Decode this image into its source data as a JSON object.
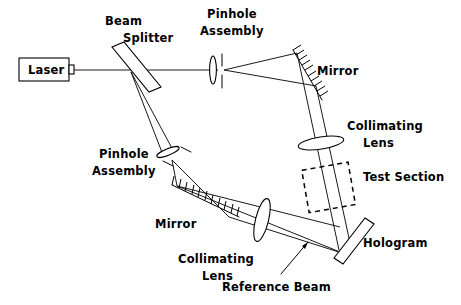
{
  "figure": {
    "background_color": "#ffffff",
    "line_color": "#000000"
  },
  "labels": {
    "laser": "Laser",
    "beam_splitter_line1": "Beam",
    "beam_splitter_line2": "Splitter",
    "pinhole_top_line1": "Pinhole",
    "pinhole_top_line2": "Assembly",
    "pinhole_left_line1": "Pinhole",
    "pinhole_left_line2": "Assembly",
    "mirror_top": "Mirror",
    "mirror_bottom": "Mirror",
    "collimating_right_line1": "Collimating",
    "collimating_right_line2": "Lens",
    "collimating_bottom_line1": "Collimating",
    "collimating_bottom_line2": "Lens",
    "test_section": "Test  Section",
    "hologram": "Hologram",
    "reference_beam": "Reference  Beam"
  },
  "components": [
    {
      "name": "laser-source",
      "label": "Laser",
      "type": "box"
    },
    {
      "name": "beam-splitter",
      "label": "Beam Splitter",
      "type": "tilted-plate"
    },
    {
      "name": "pinhole-assembly-top",
      "label": "Pinhole Assembly",
      "type": "lens-plus-aperture"
    },
    {
      "name": "mirror-top",
      "label": "Mirror",
      "type": "hatched-mirror"
    },
    {
      "name": "collimating-lens-right",
      "label": "Collimating Lens",
      "type": "lens"
    },
    {
      "name": "test-section",
      "label": "Test Section",
      "type": "dashed-region"
    },
    {
      "name": "hologram",
      "label": "Hologram",
      "type": "plate"
    },
    {
      "name": "collimating-lens-bottom",
      "label": "Collimating Lens",
      "type": "lens"
    },
    {
      "name": "mirror-bottom",
      "label": "Mirror",
      "type": "hatched-mirror"
    },
    {
      "name": "pinhole-assembly-left",
      "label": "Pinhole Assembly",
      "type": "lens-plus-aperture"
    },
    {
      "name": "reference-beam",
      "label": "Reference Beam",
      "type": "annotation"
    }
  ]
}
